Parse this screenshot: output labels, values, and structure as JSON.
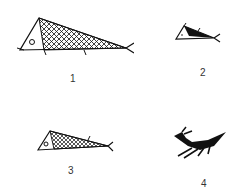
{
  "figures": [
    {
      "label": "1",
      "description": "fish with cross-hatched body"
    },
    {
      "label": "2",
      "description": "small fish with solid black back"
    },
    {
      "label": "3",
      "description": "fish with partially hatched body"
    },
    {
      "label": "4",
      "description": "black silhouette animal with antennae and legs"
    }
  ],
  "colors": {
    "ink": "#111111",
    "background": "#ffffff"
  }
}
